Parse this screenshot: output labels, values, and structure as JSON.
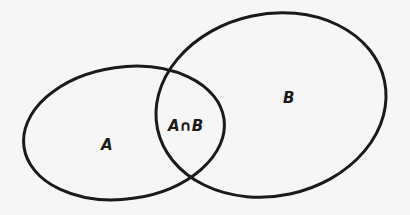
{
  "diagram": {
    "type": "venn",
    "sets": [
      {
        "id": "A",
        "label": "A"
      },
      {
        "id": "B",
        "label": "B"
      }
    ],
    "intersection": {
      "label": "A∩B"
    },
    "colors": {
      "stroke": "#1a1a1a",
      "background": "#f6f6f6"
    }
  }
}
